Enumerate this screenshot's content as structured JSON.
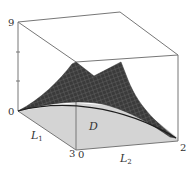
{
  "figure": {
    "type": "3d-surface-plot",
    "axes": {
      "z": {
        "tick_top": "9",
        "tick_bottom": "0",
        "minor_ticks": 2
      },
      "x": {
        "name": "L",
        "subscript": "1",
        "start": "0",
        "end": "3"
      },
      "y": {
        "name": "L",
        "subscript": "2",
        "start": "0",
        "end": "2"
      }
    },
    "region_label": "D",
    "colors": {
      "surface": "#3a3a3a",
      "surface_mesh": "#6a6a6a",
      "floor": "#d4d4d4",
      "box_edge": "#777777",
      "text": "#333333"
    }
  }
}
